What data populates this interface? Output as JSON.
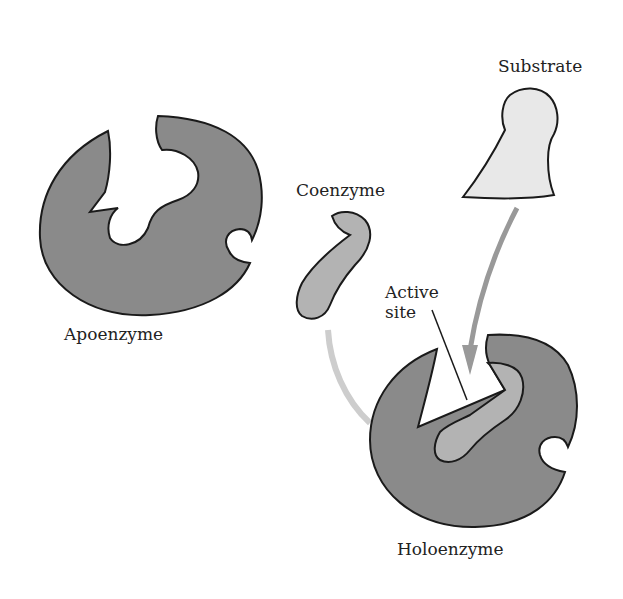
{
  "diagram": {
    "type": "enzyme-cofactor-schematic",
    "labels": {
      "apoenzyme": "Apoenzyme",
      "coenzyme": "Coenzyme",
      "substrate": "Substrate",
      "active_site_line1": "Active",
      "active_site_line2": "site",
      "holoenzyme": "Holoenzyme"
    },
    "colors": {
      "enzyme_fill": "#8a8a8a",
      "coenzyme_fill": "#b3b3b3",
      "substrate_fill": "#e8e8e8",
      "outline": "#1a1a1a",
      "substrate_arrow": "#999999",
      "coenzyme_arrow": "#cccccc",
      "background": "#ffffff"
    },
    "arrows": [
      {
        "from": "substrate",
        "to": "holoenzyme active site"
      },
      {
        "from": "coenzyme",
        "to": "holoenzyme"
      }
    ]
  }
}
